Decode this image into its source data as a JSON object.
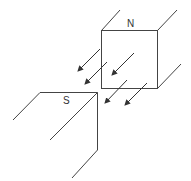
{
  "diagram": {
    "title": "",
    "labels": {
      "north": "N",
      "south": "S"
    },
    "colors": {
      "line": "#444444",
      "background": "#ffffff"
    },
    "arrows_count": 5,
    "arrow_direction": "N to S (down-left)"
  }
}
